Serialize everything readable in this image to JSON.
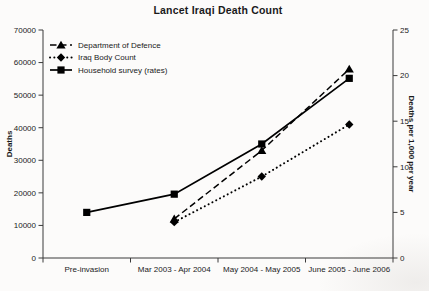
{
  "window": {
    "background": "#fcfbfa"
  },
  "chart_data": {
    "type": "line",
    "title": "Lancet Iraqi Death Count",
    "categories": [
      "Pre-invasion",
      "Mar 2003 - Apr 2004",
      "May 2004 - May 2005",
      "June 2005 - June 2006"
    ],
    "grid": false,
    "legend_position": "top-left-inside",
    "left_axis": {
      "label": "Deaths",
      "min": 0,
      "max": 70000,
      "tick_step": 10000,
      "tick_labels": [
        "0",
        "10000",
        "20000",
        "30000",
        "40000",
        "50000",
        "60000",
        "70000"
      ]
    },
    "right_axis": {
      "label": "Deaths per 1,000 per year",
      "min": 0,
      "max": 25,
      "tick_step": 5,
      "tick_labels": [
        "0",
        "5",
        "10",
        "15",
        "20",
        "25"
      ]
    },
    "series": [
      {
        "name": "Department of Defence",
        "axis": "left",
        "line_style": "dashed",
        "marker": "triangle",
        "color": "#000000",
        "values": [
          null,
          12000,
          33000,
          58000
        ]
      },
      {
        "name": "Iraq Body Count",
        "axis": "left",
        "line_style": "dotted",
        "marker": "diamond",
        "color": "#000000",
        "values": [
          null,
          11000,
          25000,
          41000
        ]
      },
      {
        "name": "Household survey (rates)",
        "axis": "right",
        "line_style": "solid",
        "marker": "square",
        "color": "#000000",
        "values": [
          5,
          7,
          12.5,
          19.7
        ]
      }
    ]
  }
}
